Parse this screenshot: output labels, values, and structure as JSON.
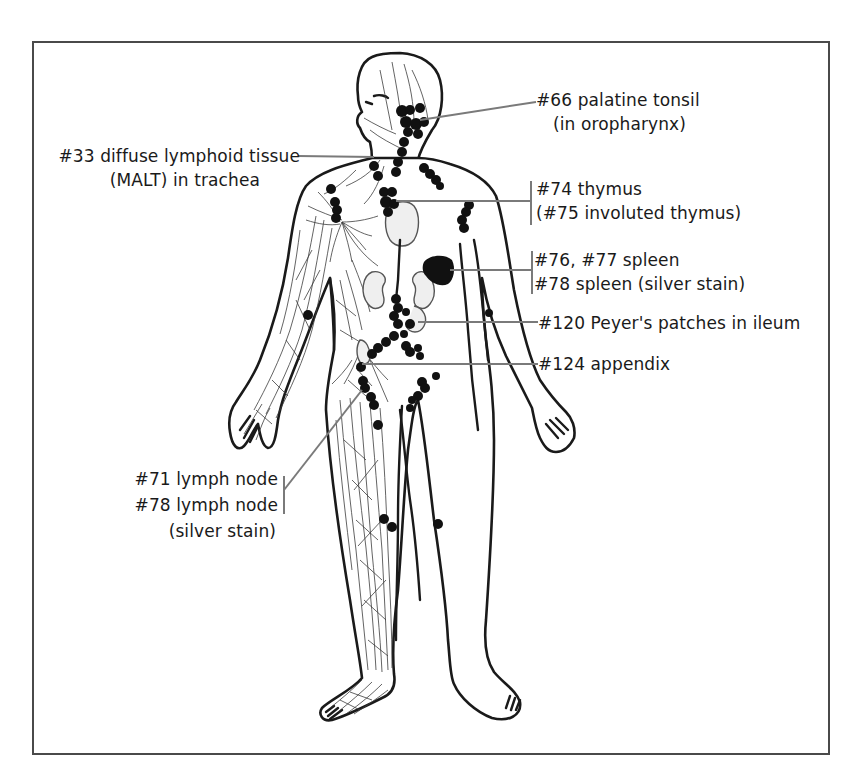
{
  "figure": {
    "frame_color": "#4a4a4a",
    "node_color": "#111111",
    "leader_color": "#7a7a7a"
  },
  "labels": {
    "palatine_tonsil": {
      "line1": "#66 palatine tonsil",
      "line2": "(in oropharynx)"
    },
    "diffuse_lymphoid": {
      "line1": "#33 diffuse lymphoid tissue",
      "line2": "(MALT) in trachea"
    },
    "thymus": {
      "line1": "#74 thymus",
      "line2": "(#75 involuted thymus)"
    },
    "spleen": {
      "line1": "#76, #77 spleen",
      "line2": "#78 spleen (silver stain)"
    },
    "peyers_patches": {
      "line1": "#120 Peyer's patches in ileum"
    },
    "appendix": {
      "line1": "#124 appendix"
    },
    "lymph_node": {
      "line1": "#71 lymph node",
      "line2": "#78 lymph node",
      "line3": "(silver stain)"
    }
  }
}
